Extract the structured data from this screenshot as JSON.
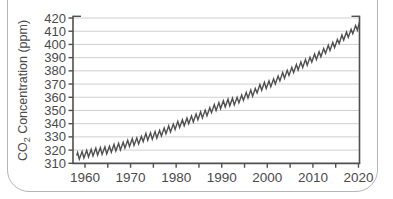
{
  "window": {
    "type": "card-panel",
    "border_color": "#b5b5b5",
    "background": "#ffffff"
  },
  "chart_data": {
    "type": "line",
    "title": "",
    "xlabel": "",
    "ylabel": "CO2 Concentration (ppm)",
    "ylabel_parts": {
      "prefix": "CO",
      "sub": "2",
      "rest": " Concentration (ppm)"
    },
    "xlim": [
      1957.4,
      2020.4
    ],
    "ylim": [
      310,
      420
    ],
    "yticks": [
      310,
      320,
      330,
      340,
      350,
      360,
      370,
      380,
      390,
      400,
      410,
      420
    ],
    "xticks_labeled": [
      1960,
      1970,
      1980,
      1990,
      2000,
      2010,
      2020
    ],
    "xtick_minor_step_years": 5,
    "grid": "horizontal-only",
    "legend": "none",
    "series": [
      {
        "name": "Atmospheric CO2, Mauna Loa (Keeling curve), monthly with seasonal cycle",
        "years": [
          1958,
          1959,
          1960,
          1961,
          1962,
          1963,
          1964,
          1965,
          1966,
          1967,
          1968,
          1969,
          1970,
          1971,
          1972,
          1973,
          1974,
          1975,
          1976,
          1977,
          1978,
          1979,
          1980,
          1981,
          1982,
          1983,
          1984,
          1985,
          1986,
          1987,
          1988,
          1989,
          1990,
          1991,
          1992,
          1993,
          1994,
          1995,
          1996,
          1997,
          1998,
          1999,
          2000,
          2001,
          2002,
          2003,
          2004,
          2005,
          2006,
          2007,
          2008,
          2009,
          2010,
          2011,
          2012,
          2013,
          2014,
          2015,
          2016,
          2017,
          2018,
          2019,
          2020
        ],
        "annual_mean_ppm": [
          315.3,
          316.0,
          316.9,
          317.6,
          318.5,
          319.0,
          319.6,
          320.0,
          321.4,
          322.2,
          323.0,
          324.6,
          325.7,
          326.3,
          327.5,
          329.7,
          330.2,
          331.1,
          332.0,
          333.8,
          335.4,
          336.8,
          338.8,
          340.1,
          341.4,
          343.0,
          344.4,
          346.0,
          347.4,
          349.2,
          351.6,
          353.1,
          354.4,
          355.6,
          356.4,
          357.1,
          358.8,
          360.8,
          362.6,
          363.7,
          366.7,
          368.4,
          369.5,
          371.1,
          373.2,
          375.8,
          377.5,
          379.8,
          381.9,
          383.8,
          385.6,
          387.4,
          389.9,
          391.6,
          393.9,
          396.5,
          398.6,
          400.8,
          404.2,
          406.5,
          408.5,
          411.4,
          414.2
        ],
        "seasonal_amplitude_ppm": 2.9,
        "seasonal_peak_month": "May",
        "seasonal_trough_month": "October"
      }
    ],
    "colors": {
      "line": "#4f4f4f",
      "axis": "#4f4f4f",
      "grid": "#cfcfcf",
      "text": "#4a4a4a"
    }
  }
}
